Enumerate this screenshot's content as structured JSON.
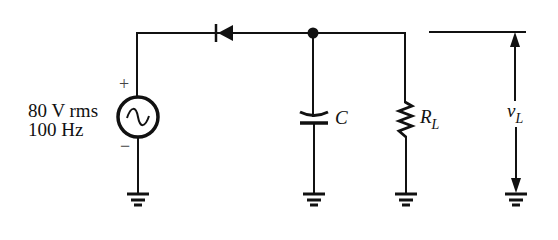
{
  "diagram": {
    "source": {
      "voltage_label": "80 V rms",
      "frequency_label": "100 Hz",
      "plus_label": "+",
      "minus_label": "−",
      "icon": "ac-source-icon"
    },
    "components": {
      "diode": {
        "icon": "diode-icon",
        "orientation": "cathode-left"
      },
      "capacitor": {
        "label": "C",
        "icon": "capacitor-icon"
      },
      "resistor": {
        "label_main": "R",
        "label_sub": "L",
        "icon": "resistor-icon"
      },
      "output": {
        "label_main": "v",
        "label_sub": "L"
      }
    },
    "grounds": 4,
    "colors": {
      "line": "#111111",
      "background": "#ffffff"
    }
  }
}
